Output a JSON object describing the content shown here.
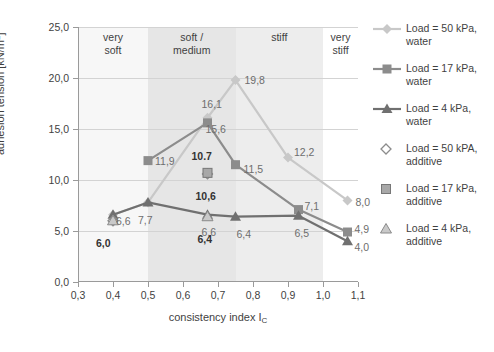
{
  "chart_data": {
    "type": "line",
    "title": "",
    "xlabel": "consistency index I_C",
    "ylabel": "adhesion tension [kN/m²]",
    "xlim": [
      0.3,
      1.1
    ],
    "ylim": [
      0.0,
      25.0
    ],
    "xticks": [
      "0,3",
      "0,4",
      "0,5",
      "0,6",
      "0,7",
      "0,8",
      "0,9",
      "1,0",
      "1,1"
    ],
    "xtick_values": [
      0.3,
      0.4,
      0.5,
      0.6,
      0.7,
      0.8,
      0.9,
      1.0,
      1.1
    ],
    "yticks": [
      "0,0",
      "5,0",
      "10,0",
      "15,0",
      "20,0",
      "25,0"
    ],
    "ytick_values": [
      0,
      5,
      10,
      15,
      20,
      25
    ],
    "grid": "horizontal",
    "legend_position": "right",
    "zones": [
      {
        "label": "very\nsoft",
        "x0": 0.3,
        "x1": 0.5,
        "shade": "#f7f7f7"
      },
      {
        "label": "soft /\nmedium",
        "x0": 0.5,
        "x1": 0.75,
        "shade": "#e6e6e6"
      },
      {
        "label": "stiff",
        "x0": 0.75,
        "x1": 1.0,
        "shade": "#ededed"
      },
      {
        "label": "very\nstiff",
        "x0": 1.0,
        "x1": 1.1,
        "shade": "#ffffff"
      }
    ],
    "series": [
      {
        "name": "Load = 50 kPa, water",
        "marker": "diamond",
        "color": "#c8c8c8",
        "style": "line",
        "x": [
          0.4,
          0.5,
          0.67,
          0.75,
          0.9,
          1.07
        ],
        "y": [
          6.6,
          7.8,
          16.1,
          19.8,
          12.2,
          8.0
        ],
        "labels": [
          "6,6",
          "",
          "16,1",
          "19,8",
          "12,2",
          "8,0"
        ]
      },
      {
        "name": "Load = 17 kPa, water",
        "marker": "square",
        "color": "#8c8c8c",
        "style": "line",
        "x": [
          0.5,
          0.67,
          0.75,
          0.93,
          1.07
        ],
        "y": [
          11.9,
          15.6,
          11.5,
          7.1,
          4.9
        ],
        "labels": [
          "11,9",
          "15,6",
          "11,5",
          "7,1",
          "4,9"
        ]
      },
      {
        "name": "Load = 4 kPa, water",
        "marker": "triangle",
        "color": "#707070",
        "style": "line",
        "x": [
          0.4,
          0.5,
          0.67,
          0.75,
          0.93,
          1.07
        ],
        "y": [
          6.6,
          7.8,
          6.6,
          6.4,
          6.5,
          4.0
        ],
        "labels": [
          "",
          "7,7",
          "6,6",
          "6,4",
          "6,5",
          "4,0"
        ]
      },
      {
        "name": "Load = 50 kPA, additive",
        "marker": "diamond-open",
        "color": "#8c8c8c",
        "style": "points",
        "x": [
          0.4,
          0.67
        ],
        "y": [
          6.0,
          10.6
        ],
        "labels": [
          "6,0",
          "10,6"
        ],
        "bold": true
      },
      {
        "name": "Load = 17 kPa, additive",
        "marker": "square-filled",
        "color": "#a8a8a8",
        "style": "points",
        "x": [
          0.67
        ],
        "y": [
          10.7
        ],
        "labels": [
          "10.7"
        ],
        "bold": true
      },
      {
        "name": "Load = 4 kPa, additive",
        "marker": "triangle-open",
        "color": "#9a9a9a",
        "style": "points",
        "x": [
          0.4,
          0.67
        ],
        "y": [
          6.0,
          6.4
        ],
        "labels": [
          "",
          "6,4"
        ],
        "bold": true
      }
    ]
  },
  "axes": {
    "ytitle_main": "adhesion tension [kN/m",
    "ytitle_sup": "2",
    "ytitle_end": "]",
    "xtitle_main": "consistency index I",
    "xtitle_sub": "C"
  },
  "legend": {
    "items": [
      {
        "line1": "Load = 50 kPa,",
        "line2": "water",
        "key": "line-diamond-key"
      },
      {
        "line1": "Load = 17 kPa,",
        "line2": "water",
        "key": "line-square-key"
      },
      {
        "line1": "Load = 4 kPa,",
        "line2": "water",
        "key": "line-triangle-key"
      },
      {
        "line1": "Load = 50 kPA,",
        "line2": "additive",
        "key": "point-diamond-key"
      },
      {
        "line1": "Load = 17 kPa,",
        "line2": "additive",
        "key": "point-square-key"
      },
      {
        "line1": "Load = 4 kPa,",
        "line2": "additive",
        "key": "point-triangle-key"
      }
    ]
  }
}
